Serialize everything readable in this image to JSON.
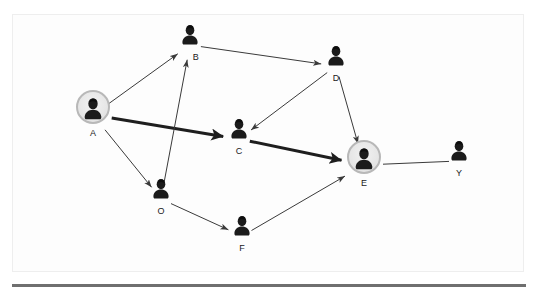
{
  "diagram": {
    "type": "directed-node-link-graph",
    "background_color": "#ffffff",
    "frame_color": "#eeeeee",
    "edge_color": "#3a3a3a",
    "highlight_ring_color": "#b8b8b8",
    "bottom_rule_color": "#6f6f6f"
  },
  "nodes": [
    {
      "id": "A",
      "label": "A",
      "x": 93,
      "y": 115,
      "highlighted": true,
      "icon": "person-avatar-icon",
      "label_position": "below"
    },
    {
      "id": "B",
      "label": "B",
      "x": 190,
      "y": 45,
      "highlighted": false,
      "icon": "person-avatar-icon",
      "label_position": "below-right"
    },
    {
      "id": "C",
      "label": "C",
      "x": 239,
      "y": 139,
      "highlighted": false,
      "icon": "person-avatar-icon",
      "label_position": "below"
    },
    {
      "id": "D",
      "label": "D",
      "x": 336,
      "y": 66,
      "highlighted": false,
      "icon": "person-avatar-icon",
      "label_position": "below"
    },
    {
      "id": "E",
      "label": "E",
      "x": 364,
      "y": 165,
      "highlighted": true,
      "icon": "person-avatar-icon",
      "label_position": "below"
    },
    {
      "id": "F",
      "label": "F",
      "x": 242,
      "y": 236,
      "highlighted": false,
      "icon": "person-avatar-icon",
      "label_position": "below"
    },
    {
      "id": "O",
      "label": "O",
      "x": 161,
      "y": 199,
      "highlighted": false,
      "icon": "person-avatar-icon",
      "label_position": "below"
    },
    {
      "id": "Y",
      "label": "Y",
      "x": 459,
      "y": 161,
      "highlighted": false,
      "icon": "person-avatar-icon",
      "label_position": "below"
    }
  ],
  "edges": [
    {
      "id": "A-B",
      "from": "A",
      "to": "B",
      "directed": true,
      "weight": "thin",
      "width": 1
    },
    {
      "id": "A-C",
      "from": "A",
      "to": "C",
      "directed": true,
      "weight": "thick",
      "width": 3
    },
    {
      "id": "A-O",
      "from": "A",
      "to": "O",
      "directed": true,
      "weight": "thin",
      "width": 1
    },
    {
      "id": "B-D",
      "from": "B",
      "to": "D",
      "directed": true,
      "weight": "thin",
      "width": 1
    },
    {
      "id": "D-C",
      "from": "D",
      "to": "C",
      "directed": true,
      "weight": "thin",
      "width": 1
    },
    {
      "id": "D-E",
      "from": "D",
      "to": "E",
      "directed": true,
      "weight": "thin",
      "width": 1
    },
    {
      "id": "C-E",
      "from": "C",
      "to": "E",
      "directed": true,
      "weight": "thick",
      "width": 3
    },
    {
      "id": "O-B",
      "from": "O",
      "to": "B",
      "directed": true,
      "weight": "thin",
      "width": 1
    },
    {
      "id": "O-F",
      "from": "O",
      "to": "F",
      "directed": true,
      "weight": "thin",
      "width": 1
    },
    {
      "id": "F-E",
      "from": "F",
      "to": "E",
      "directed": true,
      "weight": "thin",
      "width": 1
    },
    {
      "id": "E-Y",
      "from": "E",
      "to": "Y",
      "directed": false,
      "weight": "thin",
      "width": 1
    }
  ],
  "chart_data": {
    "type": "diagram",
    "node_ids": [
      "A",
      "B",
      "C",
      "D",
      "E",
      "F",
      "O",
      "Y"
    ],
    "highlighted_nodes": [
      "A",
      "E"
    ],
    "edge_list": [
      "A->B",
      "A->C",
      "A->O",
      "B->D",
      "D->C",
      "D->E",
      "C->E",
      "O->B",
      "O->F",
      "F->E",
      "E--Y"
    ],
    "emphasized_path": [
      "A",
      "C",
      "E"
    ]
  }
}
